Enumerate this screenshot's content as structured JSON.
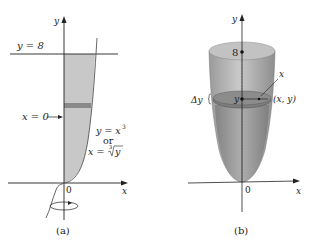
{
  "panel_a": {
    "caption": "(a)",
    "y_axis_label": "y",
    "x_axis_label": "x",
    "origin_label": "0",
    "line_label": "y = 8",
    "boundary_label": "x = 0",
    "curve_label_1": "y = x",
    "curve_label_1_exp": "3",
    "curve_label_or": "or",
    "curve_label_2": "x = ",
    "curve_label_2_root_index": "3",
    "curve_label_2_radicand": "y"
  },
  "panel_b": {
    "caption": "(b)",
    "y_axis_label": "y",
    "x_axis_label": "x",
    "origin_label": "0",
    "top_label": "8",
    "slice_y_label": "y",
    "radius_label": "x",
    "point_label": "(x, y)",
    "thickness_label": "Δy"
  },
  "colors": {
    "region_fill": "#c8c8c8",
    "strip_fill": "#8a8a8a",
    "solid_light": "#c4c4c4",
    "solid_dark": "#8c8c8c",
    "axis": "#222222"
  }
}
